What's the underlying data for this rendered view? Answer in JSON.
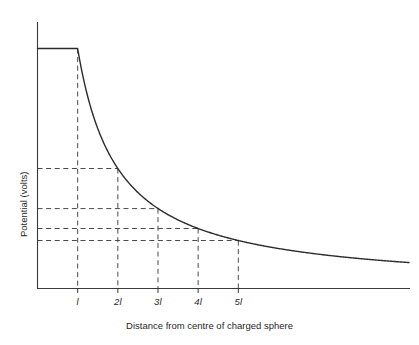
{
  "figure": {
    "background_color": "#ffffff",
    "axis_color": "#3a3a3a",
    "curve_color": "#2b2b2b",
    "guide_color": "#4a4a4a"
  },
  "axes": {
    "x_title": "Distance from centre of charged sphere",
    "y_title": "Potential  (volts)"
  },
  "ticks": {
    "x": [
      {
        "label": "l",
        "value": 1
      },
      {
        "label": "2l",
        "value": 2
      },
      {
        "label": "3l",
        "value": 3
      },
      {
        "label": "4l",
        "value": 4
      },
      {
        "label": "5l",
        "value": 5
      }
    ]
  },
  "chart_data": {
    "type": "line",
    "title": "",
    "xlabel": "Distance from centre of charged sphere",
    "ylabel": "Potential  (volts)",
    "grid": false,
    "legend": "none",
    "xlim": [
      0,
      9.25
    ],
    "ylim": [
      0,
      1.18
    ],
    "x_tick_labels": [
      "l",
      "2l",
      "3l",
      "4l",
      "5l"
    ],
    "x_tick_values": [
      1,
      2,
      3,
      4,
      5
    ],
    "y_tick_labels": [],
    "series": [
      {
        "name": "Potential V(r)",
        "comment": "V = Vmax for r <= l ; V = Vmax * (l / r) for r > l",
        "x": [
          0,
          0.25,
          0.5,
          0.75,
          1,
          1.25,
          1.5,
          1.75,
          2,
          2.5,
          3,
          3.5,
          4,
          4.5,
          5,
          5.5,
          6,
          6.5,
          7,
          7.5,
          8,
          8.5,
          9,
          9.25
        ],
        "y": [
          1,
          1,
          1,
          1,
          1,
          0.8,
          0.667,
          0.571,
          0.5,
          0.4,
          0.333,
          0.286,
          0.25,
          0.222,
          0.2,
          0.182,
          0.167,
          0.154,
          0.143,
          0.133,
          0.125,
          0.118,
          0.111,
          0.108
        ]
      }
    ],
    "guide_lines": {
      "comment": "Dashed construction lines dropped from the curve to both axes",
      "horizontal_at_y": [
        1,
        0.5,
        0.333,
        0.25,
        0.2
      ],
      "vertical_at_x": [
        1,
        2,
        3,
        4,
        5
      ]
    },
    "annotations": []
  }
}
